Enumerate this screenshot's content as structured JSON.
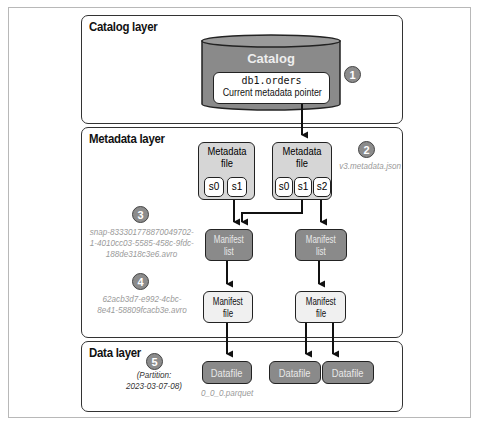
{
  "layers": {
    "catalog": {
      "title": "Catalog layer"
    },
    "metadata": {
      "title": "Metadata layer"
    },
    "data": {
      "title": "Data layer"
    }
  },
  "catalog": {
    "label": "Catalog",
    "table_name": "db1.orders",
    "pointer_label": "Current metadata pointer"
  },
  "metadata_files": [
    {
      "label_line1": "Metadata",
      "label_line2": "file",
      "snapshots": [
        "s0",
        "s1"
      ]
    },
    {
      "label_line1": "Metadata",
      "label_line2": "file",
      "snapshots": [
        "s0",
        "s1",
        "s2"
      ]
    }
  ],
  "manifest_lists": [
    {
      "line1": "Manifest",
      "line2": "list"
    },
    {
      "line1": "Manifest",
      "line2": "list"
    }
  ],
  "manifest_files": [
    {
      "line1": "Manifest",
      "line2": "file"
    },
    {
      "line1": "Manifest",
      "line2": "file"
    }
  ],
  "datafiles": [
    {
      "label": "Datafile"
    },
    {
      "label": "Datafile"
    },
    {
      "label": "Datafile"
    }
  ],
  "badges": [
    "1",
    "2",
    "3",
    "4",
    "5"
  ],
  "annotations": {
    "metadata_json": "v3.metadata.json",
    "snap_line1": "snap-833301778870049702-",
    "snap_line2": "1-4010cc03-5585-458c-9fdc-",
    "snap_line3": "188de318c3e6.avro",
    "manifest_line1": "62acb3d7-e992-4cbc-",
    "manifest_line2": "8e41-58809fcacb3e.avro",
    "partition_line1": "(Partition:",
    "partition_line2": "2023-03-07-08)",
    "datafile_name": "0_0_0.parquet"
  },
  "colors": {
    "dark_box": "#8a8a8a",
    "light_box": "#f0f0f0",
    "metadata_box": "#d6d6d6",
    "badge": "#8c8c8c"
  }
}
